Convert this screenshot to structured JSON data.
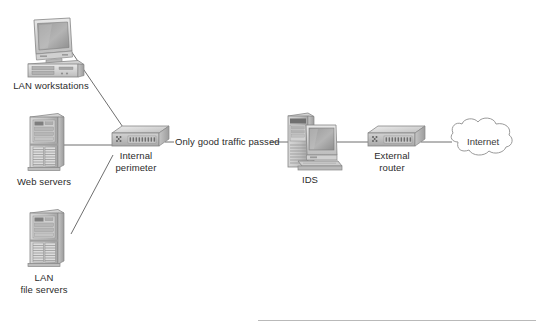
{
  "diagram": {
    "type": "network-topology",
    "title": "",
    "background_color": "#ffffff",
    "line_color": "#6f6f6f",
    "text_color": "#2b2b2b",
    "nodes": [
      {
        "id": "lan-workstations",
        "label": "LAN workstations",
        "icon": "desktop-computer-icon",
        "x": 50,
        "y": 45
      },
      {
        "id": "web-servers",
        "label": "Web servers",
        "icon": "tower-server-icon",
        "x": 50,
        "y": 148
      },
      {
        "id": "lan-file-servers",
        "label": "LAN\nfile servers",
        "icon": "tower-server-icon",
        "x": 50,
        "y": 243
      },
      {
        "id": "internal-perimeter",
        "label": "Internal\nperimeter",
        "icon": "switch-icon",
        "x": 137,
        "y": 143
      },
      {
        "id": "ids",
        "label": "IDS",
        "icon": "server-with-monitor-icon",
        "x": 310,
        "y": 143
      },
      {
        "id": "external-router",
        "label": "External\nrouter",
        "icon": "router-icon",
        "x": 392,
        "y": 143
      },
      {
        "id": "internet",
        "label": "Internet",
        "icon": "cloud-icon",
        "x": 483,
        "y": 143
      }
    ],
    "links": [
      {
        "id": "link-workstations-to-perimeter",
        "from": "lan-workstations",
        "to": "internal-perimeter",
        "label": ""
      },
      {
        "id": "link-webservers-to-perimeter",
        "from": "web-servers",
        "to": "internal-perimeter",
        "label": ""
      },
      {
        "id": "link-fileservers-to-perimeter",
        "from": "lan-file-servers",
        "to": "internal-perimeter",
        "label": ""
      },
      {
        "id": "link-perimeter-to-ids",
        "from": "internal-perimeter",
        "to": "ids",
        "label": "Only good traffic passed"
      },
      {
        "id": "link-ids-to-router",
        "from": "ids",
        "to": "external-router",
        "label": ""
      },
      {
        "id": "link-router-to-internet",
        "from": "external-router",
        "to": "internet",
        "label": ""
      }
    ],
    "flow_annotation": "Only good traffic passed"
  }
}
